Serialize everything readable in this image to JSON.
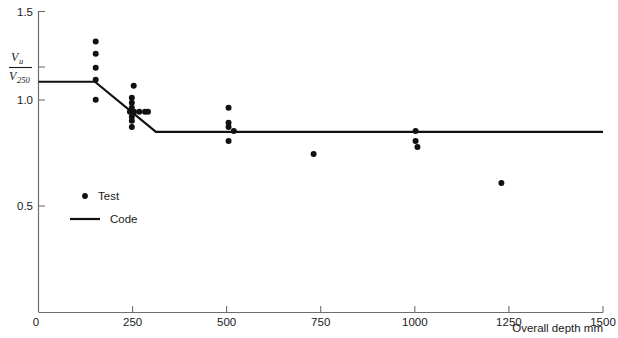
{
  "chart_data": {
    "type": "scatter",
    "title": "",
    "subtitle": "",
    "xlabel": "Overall depth mm",
    "ylabel_numerator": "V",
    "ylabel_numerator_sub": "u",
    "ylabel_denominator": "V",
    "ylabel_denominator_sub": "250",
    "ylabel_text": "Vu / V250",
    "xlim": [
      0,
      1500
    ],
    "ylim": [
      0,
      1.5
    ],
    "xticks": [
      0,
      250,
      500,
      750,
      1000,
      1250,
      1500
    ],
    "xtick_labels": [
      "0",
      "250",
      "500",
      "750",
      "1000",
      "1250",
      "1500"
    ],
    "yticks": [
      0,
      0.5,
      1.0,
      1.5
    ],
    "ytick_labels": [
      "0",
      "0.5",
      "1.0",
      "1.5"
    ],
    "y_special_tick": 1.15,
    "grid": false,
    "legend_position": "inside-left",
    "series": [
      {
        "name": "Test",
        "type": "scatter",
        "marker": "circle",
        "color": "#111111",
        "points": [
          [
            152,
            1.35
          ],
          [
            152,
            1.29
          ],
          [
            152,
            1.22
          ],
          [
            152,
            1.16
          ],
          [
            152,
            1.06
          ],
          [
            253,
            1.13
          ],
          [
            248,
            1.07
          ],
          [
            248,
            1.045
          ],
          [
            248,
            1.02
          ],
          [
            243,
            1.0
          ],
          [
            249,
            1.0
          ],
          [
            254,
            1.0
          ],
          [
            268,
            1.0
          ],
          [
            283,
            1.0
          ],
          [
            291,
            1.0
          ],
          [
            248,
            0.975
          ],
          [
            248,
            0.955
          ],
          [
            248,
            0.925
          ],
          [
            505,
            1.02
          ],
          [
            505,
            0.945
          ],
          [
            505,
            0.925
          ],
          [
            519,
            0.905
          ],
          [
            505,
            0.855
          ],
          [
            731,
            0.79
          ],
          [
            1002,
            0.905
          ],
          [
            1002,
            0.855
          ],
          [
            1007,
            0.825
          ],
          [
            1230,
            0.645
          ]
        ]
      },
      {
        "name": "Code",
        "type": "line",
        "color": "#111111",
        "points": [
          [
            0,
            1.15
          ],
          [
            150,
            1.15
          ],
          [
            312,
            0.9
          ],
          [
            1500,
            0.9
          ]
        ]
      }
    ],
    "legend": [
      {
        "label": "Test",
        "marker": "dot",
        "color": "#111111"
      },
      {
        "label": "Code",
        "marker": "line",
        "color": "#111111"
      }
    ]
  },
  "colors": {
    "axis": "#6e6e6e",
    "ink": "#111111",
    "background": "#ffffff"
  }
}
